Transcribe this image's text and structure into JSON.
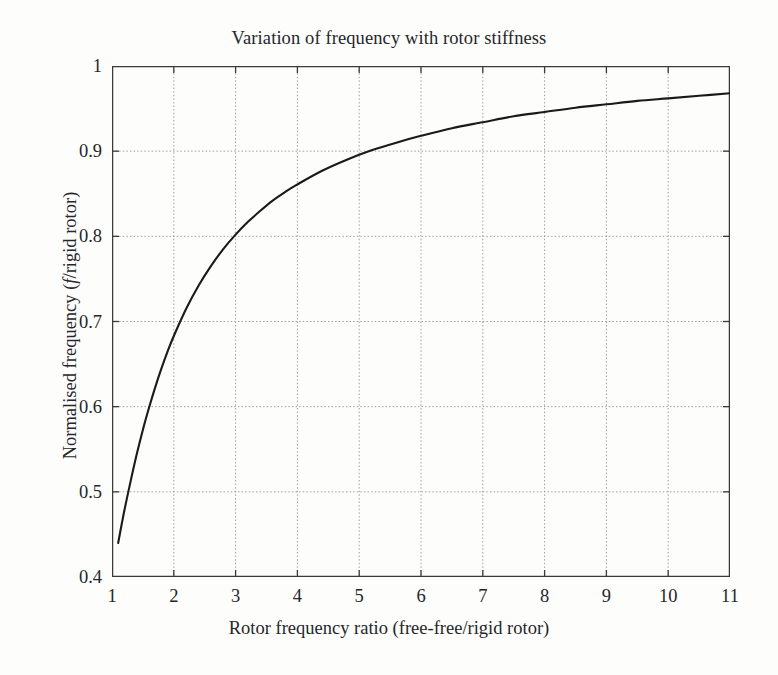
{
  "chart_data": {
    "type": "line",
    "title": "Variation of frequency with rotor stiffness",
    "xlabel": "Rotor frequency ratio (free-free/rigid rotor)",
    "ylabel_prefix": "Normalised frequency (",
    "ylabel_italic": "f",
    "ylabel_suffix": "/rigid rotor)",
    "xlim": [
      1,
      11
    ],
    "ylim": [
      0.4,
      1.0
    ],
    "xticks": [
      "1",
      "2",
      "3",
      "4",
      "5",
      "6",
      "7",
      "8",
      "9",
      "10",
      "11"
    ],
    "xtick_values": [
      1,
      2,
      3,
      4,
      5,
      6,
      7,
      8,
      9,
      10,
      11
    ],
    "yticks": [
      "0.4",
      "0.5",
      "0.6",
      "0.7",
      "0.8",
      "0.9",
      "1"
    ],
    "ytick_values": [
      0.4,
      0.5,
      0.6,
      0.7,
      0.8,
      0.9,
      1.0
    ],
    "grid": true,
    "grid_style": "dotted",
    "legend": null,
    "line_color": "#1a1a1a",
    "line_width": 2.1,
    "grid_color": "#9a9a9a",
    "axis_color": "#3a3a3a",
    "background": "#fdfdfc",
    "series": [
      {
        "name": "Normalised frequency",
        "x": [
          1.1,
          1.2,
          1.3,
          1.4,
          1.5,
          1.6,
          1.7,
          1.8,
          1.9,
          2.0,
          2.2,
          2.4,
          2.6,
          2.8,
          3.0,
          3.2,
          3.4,
          3.6,
          3.8,
          4.0,
          4.4,
          4.8,
          5.2,
          5.6,
          6.0,
          6.5,
          7.0,
          7.5,
          8.0,
          8.5,
          9.0,
          9.5,
          10.0,
          10.5,
          11.0
        ],
        "y": [
          0.44,
          0.478,
          0.512,
          0.544,
          0.573,
          0.599,
          0.623,
          0.645,
          0.665,
          0.683,
          0.715,
          0.742,
          0.765,
          0.785,
          0.802,
          0.817,
          0.83,
          0.842,
          0.852,
          0.861,
          0.877,
          0.89,
          0.901,
          0.91,
          0.918,
          0.927,
          0.934,
          0.941,
          0.946,
          0.951,
          0.955,
          0.959,
          0.962,
          0.965,
          0.968
        ]
      }
    ]
  }
}
